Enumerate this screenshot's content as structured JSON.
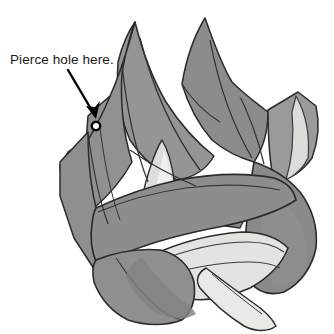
{
  "figure": {
    "background_color": "#ffffff",
    "annotation": {
      "label": "Pierce hole here.",
      "text_color": "#1a1a1a",
      "x": 10,
      "y": 52
    },
    "arrow": {
      "name": "pointer-arrow",
      "color": "#000000",
      "start_x": 68,
      "start_y": 70,
      "end_x": 95,
      "end_y": 117,
      "stroke_width": 2.4
    },
    "hole_marker": {
      "name": "pierce-hole-marker",
      "center_x": 96,
      "center_y": 126,
      "radius": 4.2,
      "fill": "#ffffff",
      "stroke": "#000000",
      "stroke_width": 2.4
    },
    "palette": {
      "paper_gray": "#919191",
      "paper_gray_dark": "#848484",
      "paper_gray_darker": "#7d7d7d",
      "paper_light": "#d7d7d3",
      "paper_lighter": "#e6e6e2",
      "paper_lightest": "#efefec",
      "outline": "#2b2b2b",
      "fold_line": "#3a3a3a"
    },
    "shapes": [
      {
        "name": "left-upper-peak-petal",
        "fill": "#919191"
      },
      {
        "name": "center-peak-petal",
        "fill": "#919191"
      },
      {
        "name": "right-upper-petal",
        "fill": "#8c8c8c"
      },
      {
        "name": "right-side-flap",
        "fill": "#9a9a9a"
      },
      {
        "name": "right-flap-inner-light",
        "fill": "#dedede"
      },
      {
        "name": "left-flap-with-hole",
        "fill": "#919191"
      },
      {
        "name": "center-light-triangle",
        "fill": "#dddddb"
      },
      {
        "name": "center-light-triangle-inner",
        "fill": "#efefec"
      },
      {
        "name": "diagonal-sash-band",
        "fill": "#8d8d8d"
      },
      {
        "name": "lower-right-lobe",
        "fill": "#8a8a8a"
      },
      {
        "name": "lower-light-fan",
        "fill": "#e3e3df"
      },
      {
        "name": "bottom-light-tail",
        "fill": "#e9e9e5"
      },
      {
        "name": "bottom-left-lobe",
        "fill": "#8f8f8f"
      },
      {
        "name": "bottom-shadow-wedge",
        "fill": "#7f7f7f"
      }
    ]
  }
}
